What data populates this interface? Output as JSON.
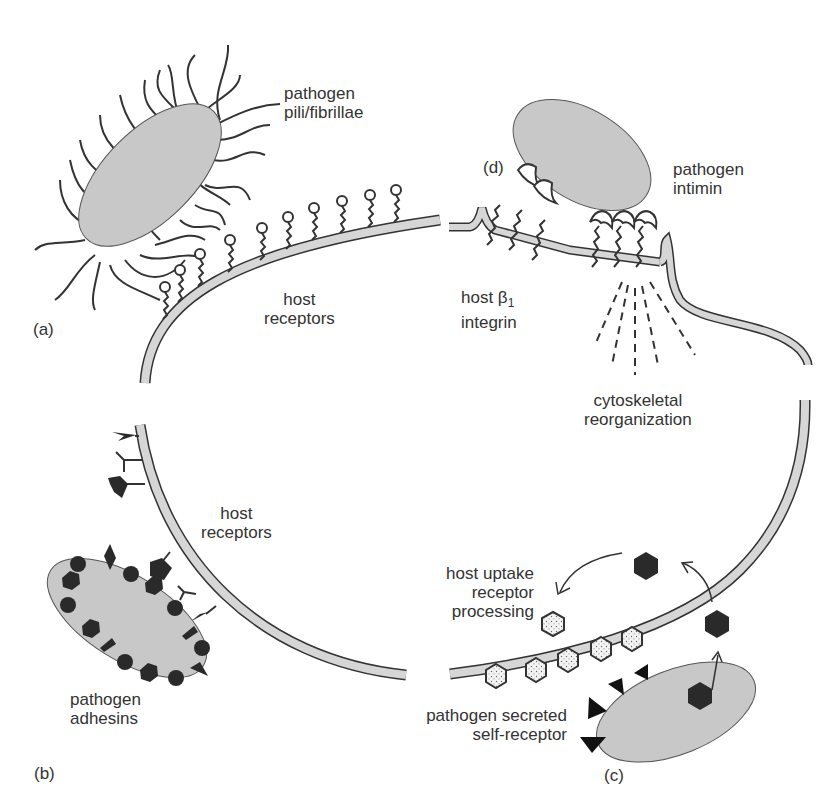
{
  "figure": {
    "panels": {
      "a": {
        "tag": "(a)",
        "pathogen_label": [
          "pathogen",
          "pili/fibrillae"
        ],
        "host_label": [
          "host",
          "receptors"
        ]
      },
      "b": {
        "tag": "(b)",
        "pathogen_label": [
          "pathogen",
          "adhesins"
        ],
        "host_label": [
          "host",
          "receptors"
        ]
      },
      "c": {
        "tag": "(c)",
        "host_label": [
          "host uptake",
          "receptor",
          "processing"
        ],
        "pathogen_label": [
          "pathogen secreted",
          "self-receptor"
        ]
      },
      "d": {
        "tag": "(d)",
        "pathogen_label": [
          "pathogen",
          "intimin"
        ],
        "host_label_line1": "host β",
        "host_label_sub": "1",
        "host_label_line2": "integrin",
        "cytoskeleton_label": [
          "cytoskeletal",
          "reorganization"
        ]
      }
    },
    "colors": {
      "pathogen_fill": "#c8c8c8",
      "membrane_fill": "#d6d6d6",
      "outline": "#333333",
      "dark_molecule": "#2a2a2a",
      "text": "#333333"
    }
  }
}
